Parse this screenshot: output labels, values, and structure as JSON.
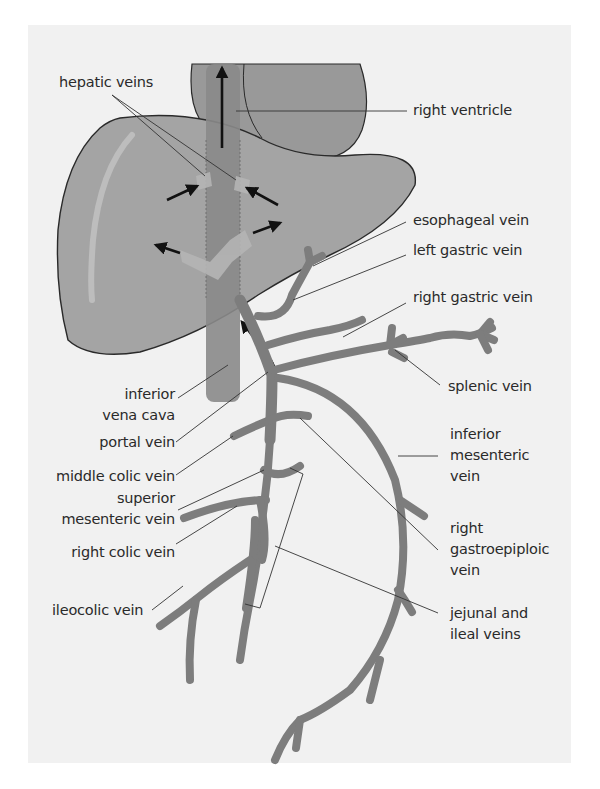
{
  "figure": {
    "colors": {
      "background": "#ffffff",
      "panel": "#f1f1f1",
      "liver": "#a4a4a4",
      "heart": "#9a9a9a",
      "ivc": "#8a8a8a",
      "vein": "#7d7d7d",
      "outline": "#2a2a2a",
      "arrow": "#111111",
      "leader_line": "#333333",
      "text": "#2a2a2a"
    },
    "labels": {
      "hepatic_veins": "hepatic veins",
      "right_ventricle": "right ventricle",
      "esophageal_vein": "esophageal vein",
      "left_gastric_vein": "left gastric vein",
      "right_gastric_vein": "right gastric vein",
      "splenic_vein": "splenic vein",
      "inferior_vena_cava": "inferior\nvena cava",
      "portal_vein": "portal vein",
      "middle_colic_vein": "middle colic vein",
      "superior_mesenteric_vein": "superior\nmesenteric vein",
      "right_colic_vein": "right colic vein",
      "ileocolic_vein": "ileocolic vein",
      "inferior_mesenteric_vein": "inferior\nmesenteric\nvein",
      "right_gastroepiploic_vein": "right\ngastroepiploic\nvein",
      "jejunal_and_ileal_veins": "jejunal and\nileal veins"
    },
    "structures": [
      "liver",
      "right ventricle",
      "inferior vena cava",
      "hepatic veins",
      "portal vein",
      "superior mesenteric vein",
      "inferior mesenteric vein",
      "splenic vein"
    ]
  }
}
